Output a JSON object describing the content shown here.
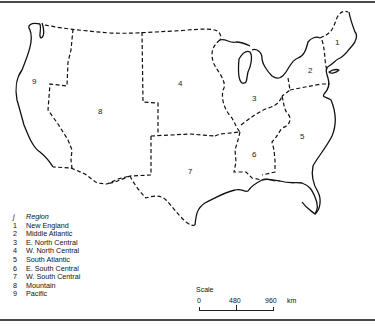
{
  "map": {
    "region_labels": [
      {
        "id": "1",
        "x": 337,
        "y": 45
      },
      {
        "id": "2",
        "x": 308,
        "y": 73
      },
      {
        "id": "3",
        "x": 253,
        "y": 100
      },
      {
        "id": "4",
        "x": 179,
        "y": 84
      },
      {
        "id": "5",
        "x": 300,
        "y": 139
      },
      {
        "id": "6",
        "x": 253,
        "y": 155
      },
      {
        "id": "7",
        "x": 189,
        "y": 173
      },
      {
        "id": "8",
        "x": 100,
        "y": 114
      },
      {
        "id": "9",
        "x": 34,
        "y": 83
      }
    ],
    "legend": {
      "header": {
        "key": "j",
        "label": "Region"
      },
      "items": [
        {
          "key": "1",
          "label": "New England"
        },
        {
          "key": "2",
          "label": "Middle Atlantic"
        },
        {
          "key": "3",
          "label": "E. North Central"
        },
        {
          "key": "4",
          "label": "W. North Central"
        },
        {
          "key": "5",
          "label": "South Atlantic"
        },
        {
          "key": "6",
          "label": "E. South Central"
        },
        {
          "key": "7",
          "label": "W. South Central"
        },
        {
          "key": "8",
          "label": "Mountain"
        },
        {
          "key": "9",
          "label": "Pacific"
        }
      ]
    },
    "scale": {
      "title": "Scale",
      "ticks": [
        "0",
        "480",
        "960"
      ],
      "unit": "km"
    }
  }
}
